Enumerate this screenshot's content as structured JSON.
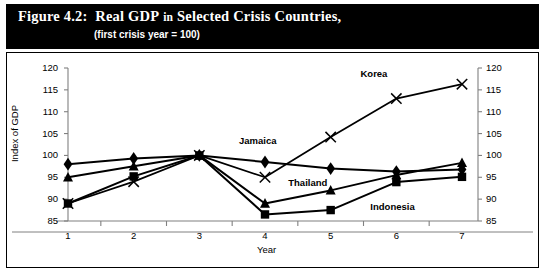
{
  "figure": {
    "number": "Figure 4.2:",
    "title_main": "Real GDP in Selected Crisis Countries,",
    "title_words": {
      "real": "Real",
      "gdp": "GDP",
      "in": "in",
      "selected": "Selected",
      "crisis": "Crisis",
      "countries": "Countries,"
    },
    "subtitle": "(first crisis year = 100)"
  },
  "chart_data": {
    "type": "line",
    "xlabel": "Year",
    "ylabel": "Index of GDP",
    "ylabel_right": "Index of GDP",
    "x": [
      1,
      2,
      3,
      4,
      5,
      6,
      7
    ],
    "categories": [
      "1",
      "2",
      "3",
      "4",
      "5",
      "6",
      "7"
    ],
    "xlim": [
      0.5,
      7.5
    ],
    "ylim": [
      85,
      120
    ],
    "yticks": [
      85,
      90,
      95,
      100,
      105,
      110,
      115,
      120
    ],
    "ytick_labels": [
      "85",
      "90",
      "95",
      "100",
      "105",
      "110",
      "115",
      "120"
    ],
    "right_axis": true,
    "right_yticks": [
      85,
      90,
      95,
      100,
      105,
      110,
      115,
      120
    ],
    "right_ytick_labels": [
      "85",
      "90",
      "95",
      "100",
      "105",
      "110",
      "115",
      "120"
    ],
    "grid": false,
    "legend_position": "inline-annotations",
    "series": [
      {
        "name": "Jamaica",
        "marker": "diamond",
        "values": [
          98.0,
          99.3,
          100.0,
          98.5,
          97.0,
          96.3,
          96.8
        ],
        "label_x": 4.0,
        "label_y": 103.0
      },
      {
        "name": "Thailand",
        "marker": "triangle",
        "values": [
          95.0,
          97.5,
          100.0,
          89.0,
          92.0,
          95.5,
          98.3
        ],
        "label_x": 4.75,
        "label_y": 93.4
      },
      {
        "name": "Indonesia",
        "marker": "square",
        "values": [
          89.0,
          95.2,
          100.0,
          86.5,
          87.5,
          93.9,
          95.1
        ],
        "label_x": 6.0,
        "label_y": 88.0
      },
      {
        "name": "Korea",
        "marker": "cross",
        "values": [
          89.0,
          94.0,
          100.0,
          95.0,
          104.2,
          113.0,
          116.3
        ],
        "label_x": 5.85,
        "label_y": 118.3
      }
    ],
    "annotations": [
      {
        "text": "Jamaica",
        "series": "Jamaica"
      },
      {
        "text": "Thailand",
        "series": "Thailand"
      },
      {
        "text": "Indonesia",
        "series": "Indonesia"
      },
      {
        "text": "Korea",
        "series": "Korea"
      }
    ],
    "colors": {
      "line": "#000000",
      "marker": "#000000",
      "axis": "#808080",
      "background": "#ffffff",
      "banner": "#000000",
      "banner_text": "#ffffff"
    }
  }
}
